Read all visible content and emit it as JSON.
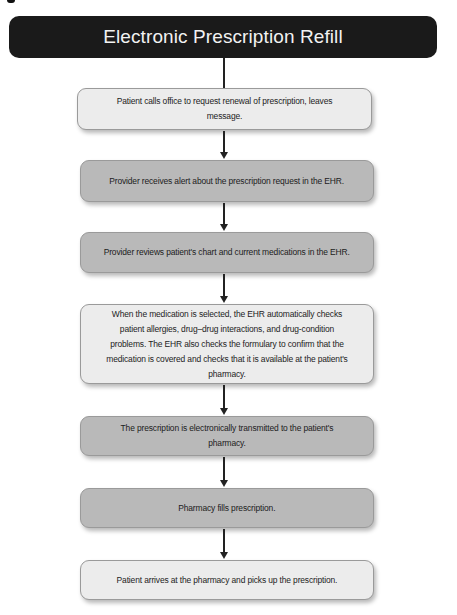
{
  "diagram": {
    "title": "Electronic Prescription Refill",
    "steps": [
      {
        "id": 1,
        "text": "Patient calls office to request renewal of prescription, leaves message.",
        "shade": "light"
      },
      {
        "id": 2,
        "text": "Provider receives alert about the prescription request in the EHR.",
        "shade": "medium"
      },
      {
        "id": 3,
        "text": "Provider reviews patient's chart and current medications in the EHR.",
        "shade": "medium"
      },
      {
        "id": 4,
        "text": "When the medication is selected, the EHR automatically checks patient allergies, drug–drug interactions, and drug-condition problems. The EHR also checks the formulary to confirm that the medication is covered and checks that it is available at the patient's pharmacy.",
        "shade": "light"
      },
      {
        "id": 5,
        "text": "The prescription is electronically transmitted to the patient's pharmacy.",
        "shade": "medium"
      },
      {
        "id": 6,
        "text": "Pharmacy fills prescription.",
        "shade": "medium"
      },
      {
        "id": 7,
        "text": "Patient arrives at the pharmacy and picks up the prescription.",
        "shade": "light"
      }
    ],
    "colors": {
      "title_bg": "#1a1a1a",
      "title_text": "#f2f2f2",
      "light_box": "#ececec",
      "medium_box": "#b9b9b9",
      "arrow": "#222222"
    }
  }
}
